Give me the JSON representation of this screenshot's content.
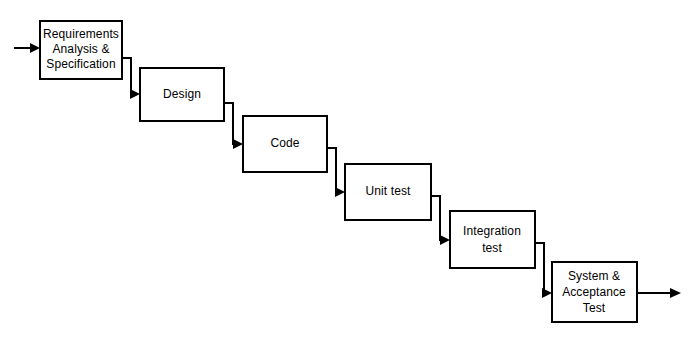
{
  "diagram": {
    "type": "process-flow",
    "background_color": "#ffffff",
    "line_color": "#000000",
    "box_fill_color": "#ffffff",
    "stages": [
      {
        "id": "requirements",
        "lines": [
          "Requirements",
          "Analysis &",
          "Specification"
        ],
        "x": 40,
        "y": 21,
        "width": 82,
        "height": 58
      },
      {
        "id": "design",
        "lines": [
          "Design"
        ],
        "x": 140,
        "y": 68,
        "width": 84,
        "height": 53
      },
      {
        "id": "code",
        "lines": [
          "Code"
        ],
        "x": 243,
        "y": 116,
        "width": 84,
        "height": 56
      },
      {
        "id": "unit-test",
        "lines": [
          "Unit test"
        ],
        "x": 345,
        "y": 164,
        "width": 86,
        "height": 56
      },
      {
        "id": "integration-test",
        "lines": [
          "Integration",
          "test"
        ],
        "x": 450,
        "y": 211,
        "width": 85,
        "height": 57
      },
      {
        "id": "system-acceptance-test",
        "lines": [
          "System &",
          "Acceptance",
          "Test"
        ],
        "x": 552,
        "y": 262,
        "width": 85,
        "height": 60
      }
    ],
    "entry_arrow": {
      "id": "entry-arrow",
      "from_x": 14,
      "to_x": 40,
      "y": 48
    },
    "exit_arrow": {
      "id": "exit-arrow",
      "from_x": 637,
      "to_x": 681,
      "y": 293
    },
    "connectors": [
      {
        "id": "requirements-to-design",
        "start_x": 122,
        "start_y": 58,
        "corner_x": 131,
        "end_y": 94,
        "end_x": 140
      },
      {
        "id": "design-to-code",
        "start_x": 224,
        "start_y": 103,
        "corner_x": 233,
        "end_y": 144,
        "end_x": 243
      },
      {
        "id": "code-to-unit-test",
        "start_x": 327,
        "start_y": 148,
        "corner_x": 336,
        "end_y": 192,
        "end_x": 345
      },
      {
        "id": "unit-test-to-integration-test",
        "start_x": 431,
        "start_y": 196,
        "corner_x": 440,
        "end_y": 240,
        "end_x": 450
      },
      {
        "id": "integration-test-to-system-test",
        "start_x": 535,
        "start_y": 243,
        "corner_x": 544,
        "end_y": 293,
        "end_x": 552
      }
    ]
  }
}
